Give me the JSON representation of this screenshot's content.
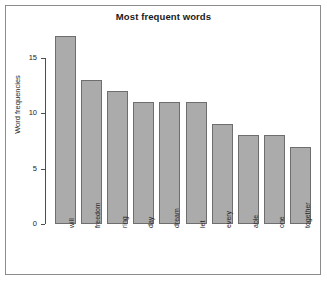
{
  "chart_data": {
    "type": "bar",
    "title": "Most frequent words",
    "xlabel": "",
    "ylabel": "Word frequencies",
    "categories": [
      "will",
      "freedom",
      "ring",
      "day",
      "dream",
      "let",
      "every",
      "able",
      "one",
      "together"
    ],
    "values": [
      17,
      13,
      12,
      11,
      11,
      11,
      9,
      8,
      8,
      7
    ],
    "ylim": [
      0,
      17.5
    ],
    "yticks": [
      0,
      5,
      10,
      15
    ],
    "ytick_labels": [
      "0",
      "5",
      "10",
      "15"
    ],
    "grid": false,
    "legend": false,
    "bar_fill_color": "#ababab",
    "bar_border_color": "#6e6e6e",
    "axis_color": "#4d4d4d",
    "background_color": "#ffffff",
    "frame_color": "#8c8c8c"
  }
}
